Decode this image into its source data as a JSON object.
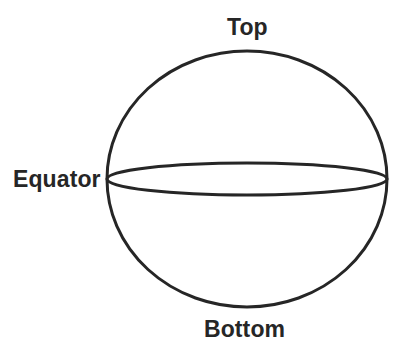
{
  "diagram": {
    "background_color": "#ffffff",
    "stroke_color": "#262626",
    "text_color": "#262626",
    "stroke_width": 3,
    "labels": {
      "top": "Top",
      "equator": "Equator",
      "bottom": "Bottom"
    },
    "shapes": {
      "sphere_outline": {
        "name": "sphere-outline",
        "type": "ellipse",
        "cx": 247,
        "cy": 179,
        "rx": 140,
        "ry": 128
      },
      "equator_ellipse": {
        "name": "equator-ellipse",
        "type": "ellipse",
        "cx": 247,
        "cy": 179,
        "rx": 140,
        "ry": 16
      }
    }
  }
}
